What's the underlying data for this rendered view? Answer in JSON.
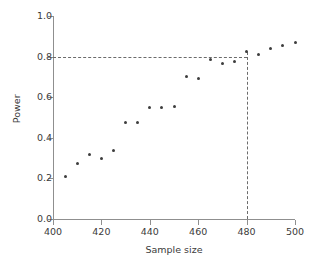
{
  "chart_data": {
    "type": "scatter",
    "title": "",
    "xlabel": "Sample size",
    "ylabel": "Power",
    "xlim": [
      400,
      500
    ],
    "ylim": [
      0.0,
      1.0
    ],
    "grid": false,
    "legend": null,
    "x_ticks": [
      "400",
      "420",
      "440",
      "460",
      "480",
      "500"
    ],
    "x_tick_values": [
      400,
      420,
      440,
      460,
      480,
      500
    ],
    "y_ticks": [
      "0.0",
      "0.2",
      "0.4",
      "0.6",
      "0.8",
      "1.0"
    ],
    "y_tick_values": [
      0.0,
      0.2,
      0.4,
      0.6,
      0.8,
      1.0
    ],
    "marker": "filled-circle",
    "marker_color": "#3d3d3d",
    "axis_color": "#8f8f8f",
    "x": [
      405,
      410,
      415,
      420,
      425,
      430,
      435,
      440,
      445,
      450,
      455,
      460,
      465,
      470,
      475,
      480,
      485,
      490,
      495,
      500
    ],
    "values": [
      0.21,
      0.275,
      0.32,
      0.3,
      0.335,
      0.475,
      0.475,
      0.55,
      0.55,
      0.555,
      0.7,
      0.69,
      0.785,
      0.765,
      0.775,
      0.823,
      0.81,
      0.84,
      0.855,
      0.87
    ],
    "annotations": [
      {
        "name": "power-threshold-line",
        "type": "hline",
        "value": 0.8,
        "style": "dashed",
        "x_from": 400,
        "x_to": 480,
        "color": "#6b6b6b"
      },
      {
        "name": "required-sample-size-line",
        "type": "vline",
        "value": 480,
        "style": "dashed",
        "y_from": 0.0,
        "y_to": 0.823,
        "color": "#6b6b6b"
      }
    ]
  }
}
